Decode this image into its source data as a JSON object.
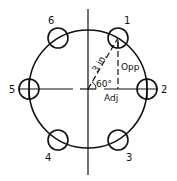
{
  "diagram": {
    "center": {
      "x": 88,
      "y": 89
    },
    "bolt_circle_radius": 59,
    "hole_radius": 10,
    "holes": [
      {
        "label": "1",
        "x": 118,
        "y": 38,
        "label_x": 124,
        "label_y": 24
      },
      {
        "label": "2",
        "x": 147,
        "y": 89,
        "label_x": 161,
        "label_y": 93
      },
      {
        "label": "3",
        "x": 118,
        "y": 140,
        "label_x": 126,
        "label_y": 161
      },
      {
        "label": "4",
        "x": 58,
        "y": 140,
        "label_x": 45,
        "label_y": 161
      },
      {
        "label": "5",
        "x": 29,
        "y": 89,
        "label_x": 9,
        "label_y": 93
      },
      {
        "label": "6",
        "x": 58,
        "y": 38,
        "label_x": 48,
        "label_y": 24
      }
    ],
    "annotations": {
      "radius_label": "3 in.",
      "angle_label": "60°",
      "opposite_label": "Opp",
      "adjacent_label": "Adj"
    },
    "colors": {
      "stroke": "#111111",
      "background": "#ffffff"
    }
  }
}
